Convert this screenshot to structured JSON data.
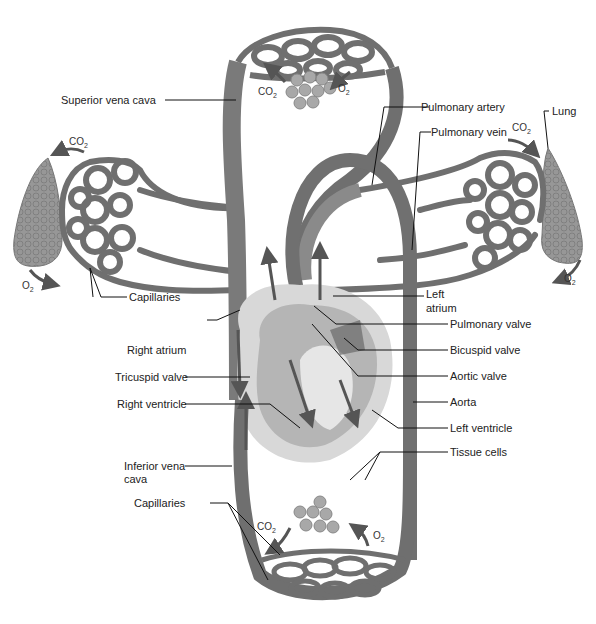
{
  "colors": {
    "vessel": "#6f6f6f",
    "vessel_light": "#9a9a9a",
    "heart_outer": "#d8d8d8",
    "heart_mid": "#b5b5b5",
    "lung": "#8e8e8e",
    "cell": "#a8a8a8",
    "leader": "#111111"
  },
  "labels": {
    "superior_vena_cava": "Superior vena cava",
    "pulmonary_artery": "Pulmonary artery",
    "pulmonary_vein": "Pulmonary vein",
    "lung": "Lung",
    "left_atrium_1": "Left",
    "left_atrium_2": "atrium",
    "pulmonary_valve": "Pulmonary valve",
    "bicuspid_valve": "Bicuspid valve",
    "aortic_valve": "Aortic valve",
    "aorta": "Aorta",
    "left_ventricle": "Left ventricle",
    "tissue_cells": "Tissue cells",
    "capillaries_upper": "Capillaries",
    "right_atrium": "Right atrium",
    "tricuspid_valve": "Tricuspid valve",
    "right_ventricle": "Right ventricle",
    "inferior_vena_cava_1": "Inferior vena",
    "inferior_vena_cava_2": "cava",
    "capillaries_lower": "Capillaries"
  },
  "gases": {
    "co2": "CO",
    "co2_sub": "2",
    "o2": "O",
    "o2_sub": "2"
  }
}
